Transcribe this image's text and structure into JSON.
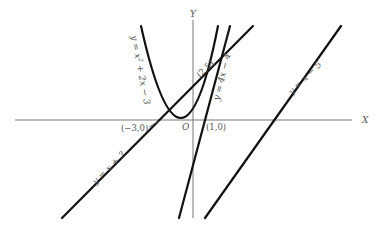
{
  "diagram": {
    "axes": {
      "x_label": "X",
      "y_label": "Y",
      "origin_label": "O"
    },
    "curves": [
      {
        "id": "parabola",
        "equation": "y = x² + 2x − 3",
        "label_parts": [
          "y = x",
          "2",
          " + 2x − 3"
        ]
      },
      {
        "id": "line-4x",
        "equation": "y = 4x − 4",
        "label": "y = 4x − 4"
      },
      {
        "id": "line-x-plus-3",
        "equation": "y = x + 3",
        "label": "y = x + 3"
      },
      {
        "id": "line-x-minus-5",
        "equation": "y = x − 5",
        "label": "y = x − 5"
      }
    ],
    "points": [
      {
        "label": "(−3,0)",
        "x": -3,
        "y": 0
      },
      {
        "label": "(1,0)",
        "x": 1,
        "y": 0
      },
      {
        "label": "(2,5)",
        "x": 2,
        "y": 5
      }
    ],
    "colors": {
      "curve": "#111111",
      "axis": "#777777",
      "text": "#555555"
    }
  }
}
